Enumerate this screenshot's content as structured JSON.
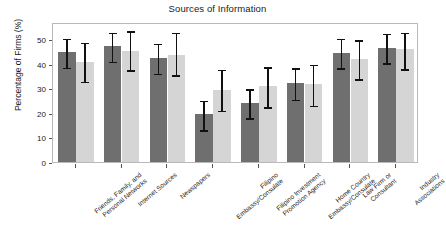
{
  "chart_data": {
    "type": "bar",
    "title": "Sources of Information",
    "xlabel": "",
    "ylabel": "Percentage of Firms (%)",
    "ylim": [
      0,
      57
    ],
    "yticks": [
      0,
      10,
      20,
      30,
      40,
      50
    ],
    "ytick_labels": [
      "0",
      "10",
      "20",
      "30",
      "40",
      "50"
    ],
    "grid": false,
    "legend": "none",
    "error_bars": "95% confidence interval",
    "categories": [
      "Friends, Family, and Personal Networks",
      "Internet Sources",
      "Newspapers",
      "Filipino Embassy/Consulate",
      "Filipino Investment Promotion Agency",
      "Home Country Embassy/Consulate",
      "Law Firm or Consultant",
      "Industry Associations"
    ],
    "series": [
      {
        "name": "Group 1",
        "color": "#6f6f6f",
        "values": [
          44.8,
          47.2,
          42.4,
          19.4,
          24.2,
          32.1,
          44.5,
          46.5
        ],
        "err_low": [
          38.6,
          41.0,
          36.1,
          13.0,
          18.0,
          25.5,
          38.4,
          40.5
        ],
        "err_high": [
          51.0,
          53.5,
          49.0,
          25.7,
          30.5,
          39.0,
          51.0,
          53.0
        ]
      },
      {
        "name": "Group 2",
        "color": "#d5d5d5",
        "values": [
          40.9,
          45.3,
          43.5,
          29.5,
          31.0,
          31.6,
          41.8,
          45.9
        ],
        "err_low": [
          32.9,
          37.5,
          35.4,
          21.0,
          22.5,
          23.1,
          33.9,
          38.0
        ],
        "err_high": [
          49.4,
          54.0,
          53.5,
          38.4,
          39.5,
          40.5,
          50.3,
          53.5
        ]
      }
    ]
  },
  "axis": {
    "title": "Sources of Information",
    "y_label": "Percentage of Firms (%)",
    "y_ticks": [
      "0",
      "10",
      "20",
      "30",
      "40",
      "50"
    ],
    "x_labels": [
      "Friends, Family, and\nPersonal Networks",
      "Internet Sources",
      "Newspapers",
      "Filipino\nEmbassy/Consulate",
      "Filipino Investment\nPromotion Agency",
      "Home Country\nEmbassy/Consulate",
      "Law Firm or\nConsultant",
      "Industry\nAssociations"
    ]
  },
  "colors": {
    "series_dark": "#6f6f6f",
    "series_light": "#d5d5d5",
    "frame": "#b9b9b9",
    "error_bar": "#111111",
    "background": "#ffffff",
    "text": "#1a1a1a"
  }
}
